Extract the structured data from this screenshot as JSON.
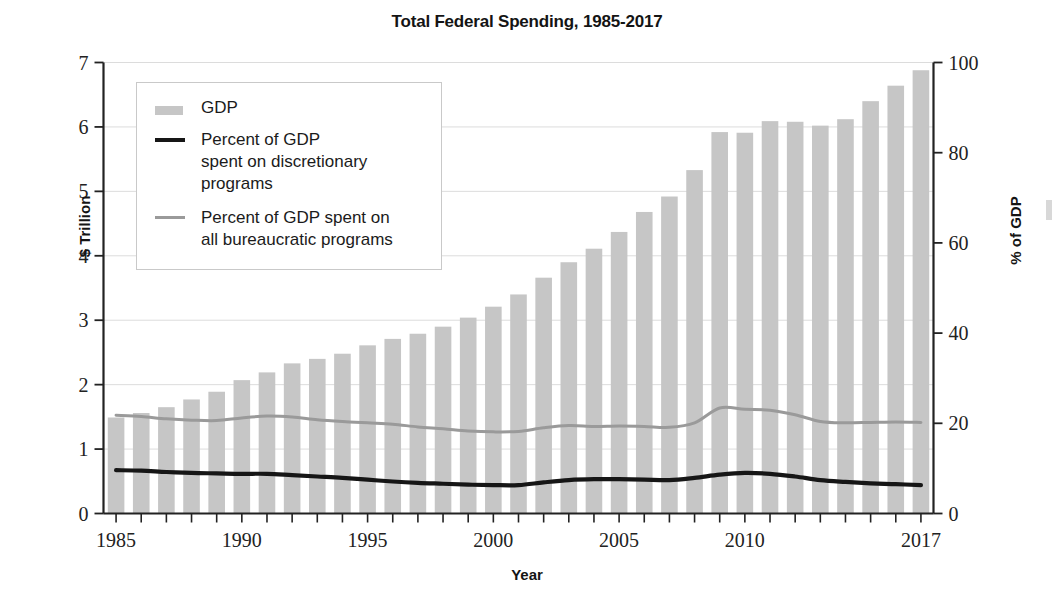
{
  "chart_data": {
    "type": "bar",
    "title": "Total Federal Spending, 1985-2017",
    "xlabel": "Year",
    "ylabel": "$ Trillion",
    "y2label": "% of GDP",
    "ylim": [
      0,
      7
    ],
    "y2lim": [
      0,
      100
    ],
    "grid": true,
    "legend_position": "upper-left",
    "x_tick_labels": [
      "1985",
      "1990",
      "1995",
      "2000",
      "2005",
      "2010",
      "2017"
    ],
    "y_tick_labels": [
      "0",
      "1",
      "2",
      "3",
      "4",
      "5",
      "6",
      "7"
    ],
    "y2_tick_labels": [
      "0",
      "20",
      "40",
      "60",
      "80",
      "100"
    ],
    "categories": [
      1985,
      1986,
      1987,
      1988,
      1989,
      1990,
      1991,
      1992,
      1993,
      1994,
      1995,
      1996,
      1997,
      1998,
      1999,
      2000,
      2001,
      2002,
      2003,
      2004,
      2005,
      2006,
      2007,
      2008,
      2009,
      2010,
      2011,
      2012,
      2013,
      2014,
      2015,
      2016,
      2017
    ],
    "series": [
      {
        "name": "GDP",
        "axis": "left",
        "units": "$ Trillion",
        "render": "bar",
        "color": "#c6c6c6",
        "values": [
          1.49,
          1.56,
          1.65,
          1.77,
          1.89,
          2.07,
          2.19,
          2.33,
          2.4,
          2.48,
          2.61,
          2.71,
          2.79,
          2.9,
          3.04,
          3.21,
          3.4,
          3.66,
          3.9,
          4.11,
          4.37,
          4.68,
          4.92,
          5.33,
          5.92,
          5.91,
          6.09,
          6.08,
          6.02,
          6.12,
          6.4,
          6.64,
          6.88
        ]
      },
      {
        "name": "Percent of GDP spent on discretionary programs",
        "axis": "right",
        "units": "% of GDP",
        "render": "line",
        "color": "#161616",
        "values": [
          9.6,
          9.5,
          9.2,
          9.0,
          8.9,
          8.8,
          8.8,
          8.5,
          8.2,
          7.9,
          7.5,
          7.1,
          6.8,
          6.6,
          6.4,
          6.3,
          6.3,
          6.9,
          7.4,
          7.6,
          7.6,
          7.5,
          7.4,
          7.9,
          8.6,
          9.0,
          8.8,
          8.2,
          7.4,
          7.0,
          6.7,
          6.5,
          6.3
        ]
      },
      {
        "name": "Percent of GDP spent on all bureaucratic programs",
        "axis": "right",
        "units": "% of GDP",
        "render": "line",
        "color": "#9a9a9a",
        "values": [
          21.8,
          21.5,
          21.0,
          20.7,
          20.6,
          21.2,
          21.6,
          21.4,
          20.8,
          20.4,
          20.1,
          19.8,
          19.2,
          18.8,
          18.3,
          18.1,
          18.2,
          19.0,
          19.5,
          19.3,
          19.4,
          19.3,
          19.1,
          20.1,
          23.4,
          23.1,
          22.9,
          21.9,
          20.4,
          20.1,
          20.2,
          20.3,
          20.2
        ]
      }
    ]
  },
  "legend": {
    "items": [
      {
        "label": "GDP",
        "swatch": "bar-swatch"
      },
      {
        "label": "Percent of GDP\nspent on discretionary\nprograms",
        "swatch": "dark-line-swatch"
      },
      {
        "label": "Percent of GDP spent on\nall bureaucratic programs",
        "swatch": "gray-line-swatch"
      }
    ]
  },
  "colors": {
    "bar": "#c6c6c6",
    "dark_line": "#161616",
    "gray_line": "#9a9a9a",
    "axis": "#222222",
    "grid": "#dcdcdc"
  }
}
